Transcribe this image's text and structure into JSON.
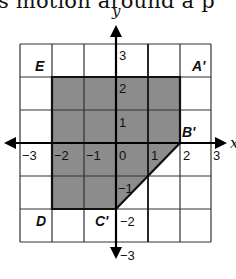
{
  "caption": {
    "text": "s motion around a p"
  },
  "graph": {
    "axis_labels": {
      "x": "x",
      "y": "y"
    },
    "x_ticks": [
      "−3",
      "−2",
      "−1",
      "0",
      "1",
      "2",
      "3"
    ],
    "y_ticks": [
      "3",
      "2",
      "1",
      "−1",
      "−2",
      "−3"
    ],
    "points": {
      "A_prime": "A'",
      "B_prime": "B'",
      "C_prime": "C'",
      "D": "D",
      "E": "E"
    },
    "grid": {
      "xmin": -3,
      "xmax": 3,
      "ymin": -3,
      "ymax": 3
    },
    "shaded_polygon": [
      [
        -2,
        2
      ],
      [
        2,
        2
      ],
      [
        2,
        0
      ],
      [
        0,
        -2
      ],
      [
        -2,
        -2
      ]
    ],
    "colors": {
      "shade": "#8c8c8c",
      "grid": "#222222",
      "axis": "#000000"
    }
  }
}
